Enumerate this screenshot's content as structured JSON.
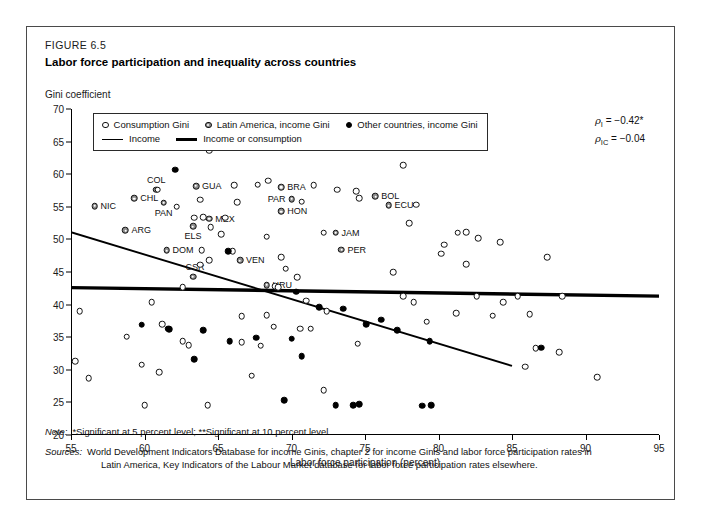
{
  "figure": {
    "number": "FIGURE 6.5",
    "title": "Labor force participation and inequality across countries"
  },
  "notes": {
    "note_label": "Note:",
    "note_text": "*Significant at 5 percent level; **Significant at 10 percent level.",
    "sources_label": "Sources:",
    "sources_line1": "World Development Indicators Database for income Ginis, chapter 2 for income Ginis and labor force participation rates in",
    "sources_line2": "Latin America, Key Indicators of the Labour Market database for labor force participation rates elsewhere."
  },
  "annotations": {
    "rho_income": {
      "symbol": "ρ",
      "subscript": "I",
      "text": "= −0.42*"
    },
    "rho_income_consumption": {
      "symbol": "ρ",
      "subscript": "IC",
      "text": "= −0.04"
    }
  },
  "chart_data": {
    "type": "scatter",
    "title": "Labor force participation and inequality across countries",
    "xlabel": "Labor force participation (percent)",
    "ylabel": "Gini coefficient",
    "xlim": [
      55,
      95
    ],
    "ylim": [
      20,
      70
    ],
    "xticks": [
      55,
      60,
      65,
      70,
      75,
      80,
      85,
      90,
      95
    ],
    "yticks": [
      20,
      25,
      30,
      35,
      40,
      45,
      50,
      55,
      60,
      65,
      70
    ],
    "grid": false,
    "legend_position": "top-left-inside",
    "legend": [
      {
        "key": "consumption",
        "marker": "open-circle",
        "label": "Consumption Gini"
      },
      {
        "key": "latin",
        "marker": "gray-circle",
        "label": "Latin America, income Gini"
      },
      {
        "key": "other",
        "marker": "filled-circle",
        "label": "Other countries, income Gini"
      },
      {
        "key": "income_line",
        "marker": "thin-line",
        "label": "Income"
      },
      {
        "key": "income_or_consumption_line",
        "marker": "thick-line",
        "label": "Income or consumption"
      }
    ],
    "trendlines": [
      {
        "name": "Income",
        "style": "thin",
        "x0": 55.0,
        "y0": 51.1,
        "x1": 85.0,
        "y1": 30.6
      },
      {
        "name": "Income or consumption",
        "style": "thick",
        "x0": 55.0,
        "y0": 42.6,
        "x1": 95.0,
        "y1": 41.3
      }
    ],
    "series": [
      {
        "name": "Latin America, income Gini",
        "key": "latin",
        "points": [
          {
            "label": "NIC",
            "x": 56.6,
            "y": 55.1,
            "label_side": "right"
          },
          {
            "label": "CHL",
            "x": 59.3,
            "y": 56.3,
            "label_side": "right"
          },
          {
            "label": "COL",
            "x": 60.8,
            "y": 57.6,
            "label_side": "above"
          },
          {
            "label": "PAN",
            "x": 61.3,
            "y": 55.6,
            "label_side": "below"
          },
          {
            "label": "ARG",
            "x": 58.7,
            "y": 51.4,
            "label_side": "right"
          },
          {
            "label": "DOM",
            "x": 61.5,
            "y": 48.3,
            "label_side": "right"
          },
          {
            "label": "CSR",
            "x": 63.3,
            "y": 44.3,
            "label_side": "above-left"
          },
          {
            "label": "GUA",
            "x": 63.5,
            "y": 58.2,
            "label_side": "right"
          },
          {
            "label": "ELS",
            "x": 63.3,
            "y": 52.0,
            "label_side": "below"
          },
          {
            "label": "MEX",
            "x": 64.4,
            "y": 53.2,
            "label_side": "right"
          },
          {
            "label": "VEN",
            "x": 66.5,
            "y": 46.8,
            "label_side": "right"
          },
          {
            "label": "URU",
            "x": 68.3,
            "y": 43.0,
            "label_side": "right"
          },
          {
            "label": "BRA",
            "x": 69.3,
            "y": 58.0,
            "label_side": "right"
          },
          {
            "label": "PAR",
            "x": 70.0,
            "y": 56.2,
            "label_side": "left"
          },
          {
            "label": "HON",
            "x": 69.3,
            "y": 54.3,
            "label_side": "right"
          },
          {
            "label": "JAM",
            "x": 73.0,
            "y": 51.0,
            "label_side": "right"
          },
          {
            "label": "PER",
            "x": 73.4,
            "y": 48.4,
            "label_side": "right"
          },
          {
            "label": "BOL",
            "x": 75.7,
            "y": 56.6,
            "label_side": "right"
          },
          {
            "label": "ECU",
            "x": 76.6,
            "y": 55.2,
            "label_side": "right"
          }
        ]
      },
      {
        "name": "Consumption Gini",
        "key": "consumption",
        "points": [
          {
            "x": 64.4,
            "y": 63.6
          },
          {
            "x": 60.9,
            "y": 57.6
          },
          {
            "x": 62.2,
            "y": 55.0
          },
          {
            "x": 63.8,
            "y": 56.1
          },
          {
            "x": 66.1,
            "y": 58.3
          },
          {
            "x": 67.7,
            "y": 58.4
          },
          {
            "x": 68.4,
            "y": 59.0
          },
          {
            "x": 71.5,
            "y": 58.3
          },
          {
            "x": 73.1,
            "y": 57.6
          },
          {
            "x": 74.4,
            "y": 57.4
          },
          {
            "x": 77.6,
            "y": 61.4
          },
          {
            "x": 74.6,
            "y": 56.3
          },
          {
            "x": 70.7,
            "y": 55.8
          },
          {
            "x": 66.3,
            "y": 55.7
          },
          {
            "x": 64.0,
            "y": 53.4
          },
          {
            "x": 63.4,
            "y": 53.3
          },
          {
            "x": 65.5,
            "y": 53.3
          },
          {
            "x": 64.5,
            "y": 51.9
          },
          {
            "x": 65.2,
            "y": 50.8
          },
          {
            "x": 78.5,
            "y": 55.3
          },
          {
            "x": 78.0,
            "y": 52.5
          },
          {
            "x": 81.3,
            "y": 51.0
          },
          {
            "x": 81.9,
            "y": 51.1
          },
          {
            "x": 82.7,
            "y": 50.2
          },
          {
            "x": 80.4,
            "y": 49.2
          },
          {
            "x": 80.2,
            "y": 47.8
          },
          {
            "x": 84.2,
            "y": 49.6
          },
          {
            "x": 72.2,
            "y": 51.0
          },
          {
            "x": 68.3,
            "y": 50.4
          },
          {
            "x": 63.9,
            "y": 48.3
          },
          {
            "x": 66.0,
            "y": 48.2
          },
          {
            "x": 69.3,
            "y": 47.3
          },
          {
            "x": 64.4,
            "y": 46.8
          },
          {
            "x": 63.8,
            "y": 46.1
          },
          {
            "x": 69.6,
            "y": 45.5
          },
          {
            "x": 70.4,
            "y": 44.2
          },
          {
            "x": 87.4,
            "y": 47.3
          },
          {
            "x": 81.9,
            "y": 46.2
          },
          {
            "x": 76.9,
            "y": 45.0
          },
          {
            "x": 62.6,
            "y": 42.7
          },
          {
            "x": 68.9,
            "y": 42.8
          },
          {
            "x": 69.1,
            "y": 42.7
          },
          {
            "x": 60.5,
            "y": 40.4
          },
          {
            "x": 55.6,
            "y": 39.0
          },
          {
            "x": 77.6,
            "y": 41.3
          },
          {
            "x": 82.6,
            "y": 41.3
          },
          {
            "x": 85.4,
            "y": 41.3
          },
          {
            "x": 88.4,
            "y": 41.3
          },
          {
            "x": 71.0,
            "y": 40.6
          },
          {
            "x": 78.3,
            "y": 40.4
          },
          {
            "x": 84.4,
            "y": 40.4
          },
          {
            "x": 72.4,
            "y": 39.0
          },
          {
            "x": 66.6,
            "y": 38.2
          },
          {
            "x": 68.3,
            "y": 38.4
          },
          {
            "x": 81.2,
            "y": 38.7
          },
          {
            "x": 83.7,
            "y": 38.3
          },
          {
            "x": 86.2,
            "y": 38.5
          },
          {
            "x": 79.2,
            "y": 37.4
          },
          {
            "x": 61.2,
            "y": 37.0
          },
          {
            "x": 68.8,
            "y": 36.6
          },
          {
            "x": 70.6,
            "y": 36.3
          },
          {
            "x": 71.3,
            "y": 36.3
          },
          {
            "x": 58.8,
            "y": 35.1
          },
          {
            "x": 62.6,
            "y": 34.4
          },
          {
            "x": 63.0,
            "y": 33.8
          },
          {
            "x": 66.6,
            "y": 34.2
          },
          {
            "x": 67.9,
            "y": 33.7
          },
          {
            "x": 74.5,
            "y": 34.0
          },
          {
            "x": 90.8,
            "y": 28.9
          },
          {
            "x": 88.2,
            "y": 32.7
          },
          {
            "x": 55.3,
            "y": 31.3
          },
          {
            "x": 59.8,
            "y": 30.8
          },
          {
            "x": 61.0,
            "y": 29.6
          },
          {
            "x": 56.2,
            "y": 28.7
          },
          {
            "x": 60.0,
            "y": 24.6
          },
          {
            "x": 64.3,
            "y": 24.6
          },
          {
            "x": 67.3,
            "y": 29.1
          },
          {
            "x": 72.2,
            "y": 26.9
          },
          {
            "x": 85.9,
            "y": 30.5
          },
          {
            "x": 86.6,
            "y": 33.3
          }
        ]
      },
      {
        "name": "Other countries, income Gini",
        "key": "other",
        "points": [
          {
            "x": 62.1,
            "y": 60.7
          },
          {
            "x": 65.7,
            "y": 48.2
          },
          {
            "x": 70.3,
            "y": 42.0
          },
          {
            "x": 71.9,
            "y": 39.6
          },
          {
            "x": 73.5,
            "y": 39.4
          },
          {
            "x": 76.1,
            "y": 37.7
          },
          {
            "x": 75.1,
            "y": 37.0
          },
          {
            "x": 77.2,
            "y": 36.1
          },
          {
            "x": 59.8,
            "y": 36.9
          },
          {
            "x": 61.6,
            "y": 36.3
          },
          {
            "x": 61.7,
            "y": 36.2
          },
          {
            "x": 64.0,
            "y": 36.1
          },
          {
            "x": 65.8,
            "y": 34.4
          },
          {
            "x": 67.6,
            "y": 34.9
          },
          {
            "x": 70.0,
            "y": 34.8
          },
          {
            "x": 79.4,
            "y": 34.4
          },
          {
            "x": 87.0,
            "y": 33.4
          },
          {
            "x": 70.7,
            "y": 32.1
          },
          {
            "x": 63.4,
            "y": 31.6
          },
          {
            "x": 69.5,
            "y": 25.3
          },
          {
            "x": 73.0,
            "y": 24.6
          },
          {
            "x": 74.2,
            "y": 24.6
          },
          {
            "x": 74.6,
            "y": 24.7
          },
          {
            "x": 78.9,
            "y": 24.5
          },
          {
            "x": 79.5,
            "y": 24.6
          }
        ]
      }
    ]
  }
}
